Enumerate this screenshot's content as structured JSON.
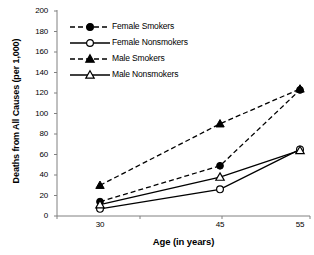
{
  "chart_data": {
    "type": "line",
    "title": "",
    "xlabel": "Age (in years)",
    "ylabel": "Deaths from All Causes (per 1,000)",
    "categories": [
      "30",
      "45",
      "55"
    ],
    "x": [
      30,
      45,
      55
    ],
    "ylim": [
      0,
      200
    ],
    "yticks": [
      "0",
      "20",
      "40",
      "60",
      "80",
      "100",
      "120",
      "140",
      "160",
      "180",
      "200"
    ],
    "ytick_values": [
      0,
      20,
      40,
      60,
      80,
      100,
      120,
      140,
      160,
      180,
      200
    ],
    "xticks": [
      "30",
      "45",
      "55"
    ],
    "grid": "off",
    "legend_position": "upper-left-inside",
    "series": [
      {
        "name": "Female Smokers",
        "values": [
          14,
          49,
          123
        ],
        "line_style": "dashed",
        "marker": "filled-circle",
        "color": "#000000"
      },
      {
        "name": "Female Nonsmokers",
        "values": [
          7,
          26,
          65
        ],
        "line_style": "solid",
        "marker": "open-circle",
        "color": "#000000"
      },
      {
        "name": "Male Smokers",
        "values": [
          30,
          90,
          124
        ],
        "line_style": "dashed",
        "marker": "filled-triangle",
        "color": "#000000"
      },
      {
        "name": "Male Nonsmokers",
        "values": [
          11,
          38,
          64
        ],
        "line_style": "solid",
        "marker": "open-triangle",
        "color": "#000000"
      }
    ]
  },
  "legend": {
    "items": [
      {
        "label": "Female Smokers"
      },
      {
        "label": "Female Nonsmokers"
      },
      {
        "label": "Male Smokers"
      },
      {
        "label": "Male Nonsmokers"
      }
    ]
  },
  "axes": {
    "y_title": "Deaths from All Causes (per 1,000)",
    "x_title": "Age (in years)",
    "y_ticks": [
      "200",
      "180",
      "160",
      "140",
      "120",
      "100",
      "80",
      "60",
      "40",
      "20",
      "0"
    ],
    "x_ticks": [
      "30",
      "45",
      "55"
    ]
  },
  "colors": {
    "line": "#000000",
    "axis": "#808080",
    "background": "#ffffff"
  }
}
